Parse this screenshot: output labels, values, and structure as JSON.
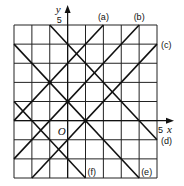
{
  "diagram": {
    "type": "coordinate-grid-with-lines",
    "grid": {
      "x_min": -3,
      "x_max": 5,
      "y_min": -3,
      "y_max": 5
    },
    "axes": {
      "x_label": "x",
      "y_label": "y",
      "x_tick_label": "5",
      "y_tick_label": "5",
      "origin_label": "O"
    },
    "lines": [
      {
        "label": "(a)",
        "equation": "y = x + 3",
        "p1": [
          -3,
          0
        ],
        "p2": [
          2,
          5
        ],
        "label_pos": [
          2,
          5
        ],
        "label_anchor": "top"
      },
      {
        "label": "(b)",
        "equation": "y = x + 1",
        "p1": [
          -3,
          -2
        ],
        "p2": [
          4,
          5
        ],
        "label_pos": [
          4,
          5
        ],
        "label_anchor": "top"
      },
      {
        "label": "(c)",
        "equation": "y = x - 1",
        "p1": [
          -2,
          -3
        ],
        "p2": [
          5,
          4
        ],
        "label_pos": [
          5,
          4
        ],
        "label_anchor": "right"
      },
      {
        "label": "(d)",
        "equation": "y = -x + 4",
        "p1": [
          -1,
          5
        ],
        "p2": [
          5,
          -1
        ],
        "label_pos": [
          5,
          -1
        ],
        "label_anchor": "right"
      },
      {
        "label": "(e)",
        "equation": "y = -x + 1",
        "p1": [
          -3,
          4
        ],
        "p2": [
          4,
          -3
        ],
        "label_pos": [
          4,
          -3
        ],
        "label_anchor": "bottom"
      },
      {
        "label": "(f)",
        "equation": "y = -x - 2",
        "p1": [
          -3,
          1
        ],
        "p2": [
          1,
          -3
        ],
        "label_pos": [
          1,
          -3
        ],
        "label_anchor": "bottom"
      }
    ],
    "points": [
      [
        -1,
        2
      ],
      [
        0,
        1
      ],
      [
        1,
        0
      ]
    ]
  }
}
